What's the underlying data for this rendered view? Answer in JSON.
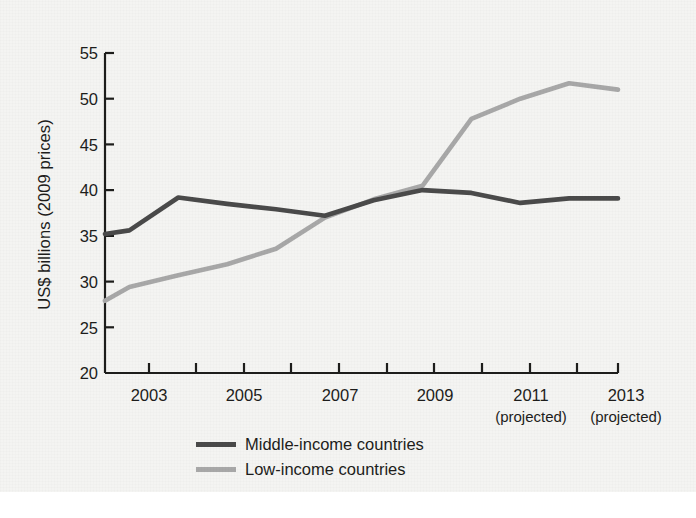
{
  "chart_data": {
    "type": "line",
    "title": "",
    "xlabel": "",
    "ylabel": "US$ billions (2009 prices)",
    "xlim": [
      2002.5,
      2013
    ],
    "ylim": [
      20,
      55
    ],
    "grid": false,
    "legend_position": "bottom-center",
    "x": [
      2002.5,
      2003,
      2004,
      2005,
      2006,
      2007,
      2008,
      2009,
      2010,
      2011,
      2012,
      2013
    ],
    "yticks": [
      20,
      25,
      30,
      35,
      40,
      45,
      50,
      55
    ],
    "ytick_labels": [
      "20",
      "25",
      "30",
      "35",
      "40",
      "45",
      "50",
      "55"
    ],
    "xticks": [
      2003,
      2004,
      2005,
      2006,
      2007,
      2008,
      2009,
      2010,
      2011,
      2012,
      2013
    ],
    "xtick_labels": [
      "2003",
      "2005",
      "2007",
      "2009",
      "2011",
      "2013"
    ],
    "xtick_label_years": [
      2003,
      2005,
      2007,
      2009,
      2011,
      2013
    ],
    "projected_note": "(projected)",
    "projected_years": [
      2011,
      2013
    ],
    "series": [
      {
        "name": "Middle-income countries",
        "color": "#4a4a4a",
        "values": [
          35.2,
          35.6,
          39.2,
          38.5,
          37.9,
          37.2,
          38.9,
          40.0,
          39.7,
          38.6,
          39.1,
          39.1
        ]
      },
      {
        "name": "Low-income countries",
        "color": "#a8a8a8",
        "values": [
          27.9,
          29.4,
          30.7,
          31.9,
          33.6,
          37.0,
          39.0,
          40.5,
          47.8,
          50.0,
          51.7,
          51.0
        ]
      }
    ]
  },
  "legend": {
    "items": [
      {
        "label": "Middle-income countries",
        "color": "#4a4a4a"
      },
      {
        "label": "Low-income countries",
        "color": "#a8a8a8"
      }
    ]
  },
  "axes": {
    "y_title": "US$ billions (2009 prices)",
    "y_ticks": [
      "55",
      "50",
      "45",
      "40",
      "35",
      "30",
      "25",
      "20"
    ],
    "x_ticks": [
      "2003",
      "2005",
      "2007",
      "2009",
      "2011",
      "2013"
    ],
    "projected_labels": [
      "(projected)",
      "(projected)"
    ]
  },
  "colors": {
    "background": "#f4f4f2",
    "axis": "#1d1d1b",
    "text": "#1d1d1b",
    "middle_income_line": "#4a4a4a",
    "low_income_line": "#a8a8a8"
  }
}
